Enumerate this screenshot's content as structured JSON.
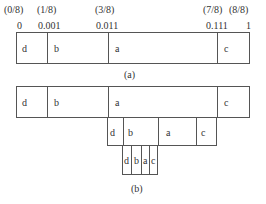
{
  "diagram_a": {
    "fraction_labels": [
      {
        "text": "(0/8)",
        "x": 4
      },
      {
        "text": "(1/8)",
        "x": 37
      },
      {
        "text": "(3/8)",
        "x": 95
      },
      {
        "text": "(7/8)",
        "x": 203
      },
      {
        "text": "(8/8)",
        "x": 229
      }
    ],
    "binary_labels": [
      {
        "text": "0",
        "x": 17
      },
      {
        "text": "0.001",
        "x": 38
      },
      {
        "text": "0.011",
        "x": 96
      },
      {
        "text": "0.111",
        "x": 206
      },
      {
        "text": "1",
        "x": 246
      }
    ],
    "segments": [
      "d",
      "b",
      "a",
      "c"
    ],
    "caption": "(a)"
  },
  "diagram_b": {
    "level1": [
      "d",
      "b",
      "a",
      "c"
    ],
    "level2": [
      "d",
      "b",
      "a",
      "c"
    ],
    "level3": [
      "d",
      "b",
      "a",
      "c"
    ],
    "caption": "(b)"
  }
}
